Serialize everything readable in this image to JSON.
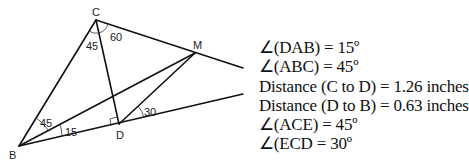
{
  "diagram": {
    "points": {
      "C": {
        "label": "C",
        "x": 96,
        "y": 20
      },
      "B": {
        "label": "B",
        "x": 19,
        "y": 146
      },
      "D": {
        "label": "D",
        "x": 119,
        "y": 124
      },
      "M": {
        "label": "M",
        "x": 195,
        "y": 53
      }
    },
    "angles": [
      {
        "label": "45",
        "at": "C"
      },
      {
        "label": "60",
        "at": "C"
      },
      {
        "label": "45",
        "at": "B"
      },
      {
        "label": "15",
        "at": "B"
      },
      {
        "label": "30",
        "at": "D"
      }
    ],
    "line_color": "#111111"
  },
  "info": {
    "lines": [
      "∠(DAB) = 15º",
      "∠(ABC) = 45º",
      "Distance (C to D) = 1.26 inches",
      "Distance (D to B) = 0.63 inches",
      "∠(ACE) = 45º",
      "∠(ECD = 30º"
    ]
  }
}
